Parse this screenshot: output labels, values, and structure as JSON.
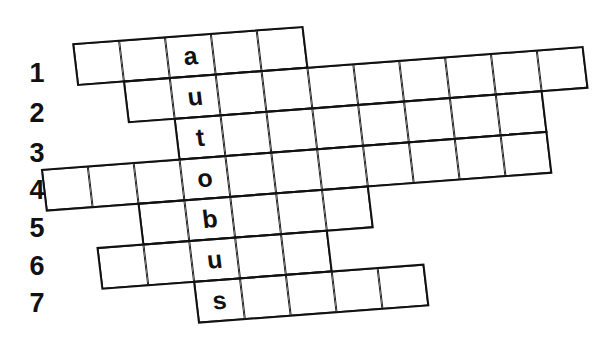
{
  "puzzle": {
    "type": "crossword",
    "keyword": "autobus",
    "cell_width": 46,
    "cell_height": 41
  },
  "row_labels": [
    "1",
    "2",
    "3",
    "4",
    "5",
    "6",
    "7"
  ],
  "rows": [
    {
      "label": "1",
      "start_col": 0,
      "end_col": 4,
      "key_letter": "a"
    },
    {
      "label": "2",
      "start_col": 1,
      "end_col": 10,
      "key_letter": "u"
    },
    {
      "label": "3",
      "start_col": 2,
      "end_col": 9,
      "key_letter": "t"
    },
    {
      "label": "4",
      "start_col": -1,
      "end_col": 9,
      "key_letter": "o"
    },
    {
      "label": "5",
      "start_col": 1,
      "end_col": 5,
      "key_letter": "b"
    },
    {
      "label": "6",
      "start_col": 0,
      "end_col": 4,
      "key_letter": "u"
    },
    {
      "label": "7",
      "start_col": 2,
      "end_col": 6,
      "key_letter": "s"
    }
  ],
  "key_column": 2,
  "colors": {
    "line": "#111111",
    "background": "#ffffff",
    "text": "#111111"
  }
}
